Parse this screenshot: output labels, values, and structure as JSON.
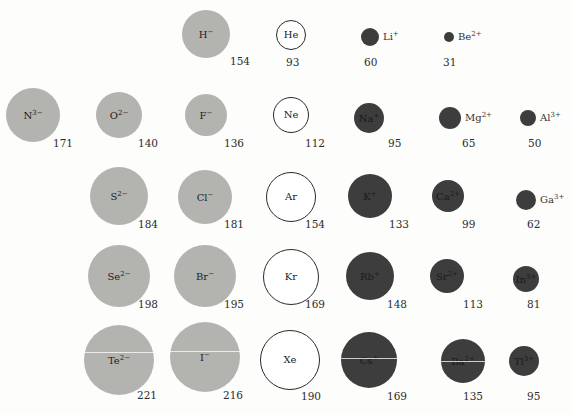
{
  "legend": {
    "anion_color": "#b3b3b0",
    "noble_gas_color": "#ffffff",
    "cation_color": "#3d3d3d"
  },
  "ions": [
    {
      "id": "h-minus",
      "symbol": "H",
      "charge": "−",
      "type": "anion",
      "radius_pm": "154",
      "label_outside": false
    },
    {
      "id": "he",
      "symbol": "He",
      "charge": "",
      "type": "noble",
      "radius_pm": "93",
      "label_outside": false
    },
    {
      "id": "li-plus",
      "symbol": "Li",
      "charge": "+",
      "type": "cation",
      "radius_pm": "60",
      "label_outside": true
    },
    {
      "id": "be-2plus",
      "symbol": "Be",
      "charge": "2+",
      "type": "cation",
      "radius_pm": "31",
      "label_outside": true
    },
    {
      "id": "n-3minus",
      "symbol": "N",
      "charge": "3−",
      "type": "anion",
      "radius_pm": "171",
      "label_outside": false
    },
    {
      "id": "o-2minus",
      "symbol": "O",
      "charge": "2−",
      "type": "anion",
      "radius_pm": "140",
      "label_outside": false
    },
    {
      "id": "f-minus",
      "symbol": "F",
      "charge": "−",
      "type": "anion",
      "radius_pm": "136",
      "label_outside": false
    },
    {
      "id": "ne",
      "symbol": "Ne",
      "charge": "",
      "type": "noble",
      "radius_pm": "112",
      "label_outside": false
    },
    {
      "id": "na-plus",
      "symbol": "Na",
      "charge": "+",
      "type": "cation",
      "radius_pm": "95",
      "label_outside": false
    },
    {
      "id": "mg-2plus",
      "symbol": "Mg",
      "charge": "2+",
      "type": "cation",
      "radius_pm": "65",
      "label_outside": true
    },
    {
      "id": "al-3plus",
      "symbol": "Al",
      "charge": "3+",
      "type": "cation",
      "radius_pm": "50",
      "label_outside": true
    },
    {
      "id": "s-2minus",
      "symbol": "S",
      "charge": "2−",
      "type": "anion",
      "radius_pm": "184",
      "label_outside": false
    },
    {
      "id": "cl-minus",
      "symbol": "Cl",
      "charge": "−",
      "type": "anion",
      "radius_pm": "181",
      "label_outside": false
    },
    {
      "id": "ar",
      "symbol": "Ar",
      "charge": "",
      "type": "noble",
      "radius_pm": "154",
      "label_outside": false
    },
    {
      "id": "k-plus",
      "symbol": "K",
      "charge": "+",
      "type": "cation",
      "radius_pm": "133",
      "label_outside": false
    },
    {
      "id": "ca-2plus",
      "symbol": "Ca",
      "charge": "2+",
      "type": "cation",
      "radius_pm": "99",
      "label_outside": false
    },
    {
      "id": "ga-3plus",
      "symbol": "Ga",
      "charge": "3+",
      "type": "cation",
      "radius_pm": "62",
      "label_outside": true
    },
    {
      "id": "se-2minus",
      "symbol": "Se",
      "charge": "2−",
      "type": "anion",
      "radius_pm": "198",
      "label_outside": false
    },
    {
      "id": "br-minus",
      "symbol": "Br",
      "charge": "−",
      "type": "anion",
      "radius_pm": "195",
      "label_outside": false
    },
    {
      "id": "kr",
      "symbol": "Kr",
      "charge": "",
      "type": "noble",
      "radius_pm": "169",
      "label_outside": false
    },
    {
      "id": "rb-plus",
      "symbol": "Rb",
      "charge": "+",
      "type": "cation",
      "radius_pm": "148",
      "label_outside": false
    },
    {
      "id": "sr-2plus",
      "symbol": "Sr",
      "charge": "2+",
      "type": "cation",
      "radius_pm": "113",
      "label_outside": false
    },
    {
      "id": "in-3plus",
      "symbol": "In",
      "charge": "3+",
      "type": "cation",
      "radius_pm": "81",
      "label_outside": false
    },
    {
      "id": "te-2minus",
      "symbol": "Te",
      "charge": "2−",
      "type": "anion",
      "radius_pm": "221",
      "label_outside": false
    },
    {
      "id": "i-minus",
      "symbol": "I",
      "charge": "−",
      "type": "anion",
      "radius_pm": "216",
      "label_outside": false
    },
    {
      "id": "xe",
      "symbol": "Xe",
      "charge": "",
      "type": "noble",
      "radius_pm": "190",
      "label_outside": false
    },
    {
      "id": "cs-plus",
      "symbol": "Cs",
      "charge": "+",
      "type": "cation",
      "radius_pm": "169",
      "label_outside": false
    },
    {
      "id": "ba-2plus",
      "symbol": "Ba",
      "charge": "2+",
      "type": "cation",
      "radius_pm": "135",
      "label_outside": false
    },
    {
      "id": "tl-3plus",
      "symbol": "Tl",
      "charge": "3+",
      "type": "cation",
      "radius_pm": "95",
      "label_outside": false
    }
  ]
}
